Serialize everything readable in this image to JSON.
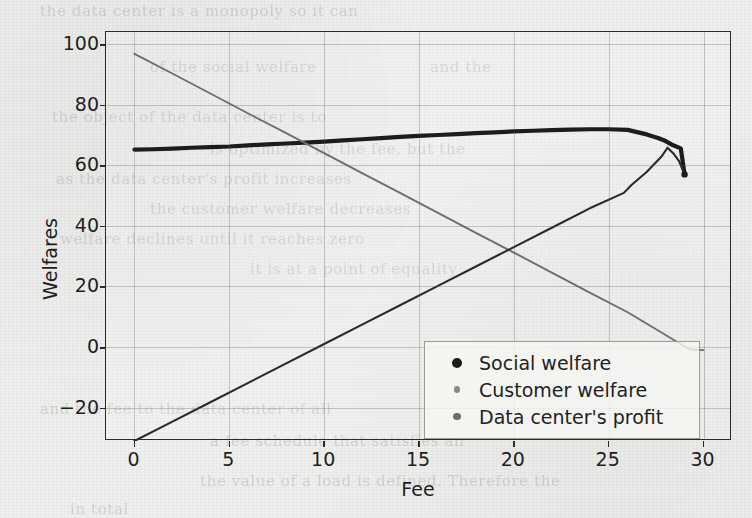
{
  "figure": {
    "background_color": "#efefed",
    "frame_color": "#2b2b2b",
    "ghost_text": [
      {
        "text": "the data center is a monopoly so it can",
        "left": 40,
        "top": 2
      },
      {
        "text": "of the social welfare",
        "left": 150,
        "top": 58
      },
      {
        "text": "and the",
        "left": 430,
        "top": 58
      },
      {
        "text": "the object of the data center is to",
        "left": 52,
        "top": 108
      },
      {
        "text": "is optimized by the fee, but the",
        "left": 210,
        "top": 140
      },
      {
        "text": "as the data center's profit increases",
        "left": 56,
        "top": 170
      },
      {
        "text": "the customer welfare decreases",
        "left": 150,
        "top": 200
      },
      {
        "text": "welfare declines until it reaches zero",
        "left": 60,
        "top": 230
      },
      {
        "text": "it is at a point of equality",
        "left": 250,
        "top": 260
      },
      {
        "text": "and the fee to the data center of all",
        "left": 40,
        "top": 400
      },
      {
        "text": "a fee schedule that satisfies all",
        "left": 210,
        "top": 432
      },
      {
        "text": "the value of a load is defined. Therefore the",
        "left": 200,
        "top": 472
      },
      {
        "text": "in total",
        "left": 70,
        "top": 500
      }
    ]
  },
  "chart_data": {
    "type": "line",
    "title": "",
    "xlabel": "Fee",
    "ylabel": "Welfares",
    "xlim": [
      -1.5,
      31.5
    ],
    "ylim": [
      -31,
      104
    ],
    "xticks": [
      0,
      5,
      10,
      15,
      20,
      25,
      30
    ],
    "yticks": [
      -20,
      0,
      20,
      40,
      60,
      80,
      100
    ],
    "ytick_labels": [
      "−20",
      "0",
      "20",
      "40",
      "60",
      "80",
      "100"
    ],
    "grid": true,
    "legend_position": "lower right",
    "series": [
      {
        "name": "Social welfare",
        "color": "#1c1c1c",
        "linewidth": 4.2,
        "marker": "dot",
        "x": [
          0,
          1,
          2,
          3,
          4,
          5,
          6,
          7,
          8,
          9,
          10,
          11,
          12,
          13,
          14,
          15,
          16,
          17,
          18,
          19,
          20,
          21,
          22,
          23,
          24,
          25,
          26,
          27,
          27.6,
          28,
          28.4,
          28.8,
          29
        ],
        "values": [
          65.2,
          65.3,
          65.5,
          65.8,
          66.0,
          66.2,
          66.6,
          66.9,
          67.2,
          67.5,
          67.8,
          68.2,
          68.6,
          69.0,
          69.4,
          69.7,
          70.0,
          70.3,
          70.6,
          70.9,
          71.2,
          71.4,
          71.6,
          71.8,
          71.9,
          71.9,
          71.7,
          70.2,
          69.0,
          68.0,
          66.6,
          65.6,
          57.0
        ]
      },
      {
        "name": "Customer welfare",
        "color": "#6e6e6e",
        "linewidth": 1.9,
        "marker": "dot",
        "x": [
          0,
          2,
          4,
          6,
          8,
          10,
          12,
          14,
          16,
          18,
          20,
          22,
          24,
          26,
          28,
          29,
          29.4,
          30
        ],
        "values": [
          96.8,
          90.3,
          83.7,
          77.1,
          70.6,
          64.0,
          57.4,
          50.9,
          44.3,
          37.7,
          31.2,
          24.6,
          18.0,
          11.5,
          4.0,
          0.2,
          -0.9,
          -1.0
        ]
      },
      {
        "name": "Data center's profit",
        "color": "#2a2a2a",
        "linewidth": 2.1,
        "marker": "dot",
        "x": [
          0,
          2,
          4,
          6,
          8,
          10,
          12,
          14,
          16,
          18,
          20,
          22,
          24,
          25.8,
          26.2,
          27,
          27.8,
          28.1,
          28.4,
          28.7,
          29
        ],
        "values": [
          -31.0,
          -24.6,
          -18.2,
          -11.8,
          -5.4,
          1.0,
          7.4,
          13.8,
          20.2,
          26.6,
          33.0,
          39.4,
          45.8,
          50.9,
          53.5,
          57.8,
          63.0,
          65.8,
          64.0,
          61.5,
          57.0
        ]
      }
    ]
  },
  "legend": {
    "items": [
      {
        "label": "Social welfare",
        "marker_color": "#1c1c1c",
        "marker_size": 5
      },
      {
        "label": "Customer welfare",
        "marker_color": "#8a8a8a",
        "marker_size": 3.4
      },
      {
        "label": "Data center's profit",
        "marker_color": "#6d6d6d",
        "marker_size": 3.6
      }
    ]
  }
}
